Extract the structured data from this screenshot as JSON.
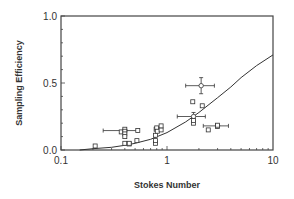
{
  "chart_data": {
    "type": "scatter",
    "title": "",
    "xlabel": "Stokes Number",
    "ylabel": "Sampling Efficiency",
    "xscale": "log",
    "xlim": [
      0.1,
      10
    ],
    "ylim": [
      0.0,
      1.0
    ],
    "xticks": [
      "0.1",
      "1",
      "10"
    ],
    "yticks": [
      "0.0",
      "0.5",
      "1.0"
    ],
    "grid": false,
    "legend": null,
    "series": [
      {
        "name": "measured",
        "marker": "square",
        "points": [
          {
            "x": 0.21,
            "y": 0.03
          },
          {
            "x": 0.37,
            "y": 0.135
          },
          {
            "x": 0.4,
            "y": 0.155
          },
          {
            "x": 0.4,
            "y": 0.14
          },
          {
            "x": 0.4,
            "y": 0.12
          },
          {
            "x": 0.4,
            "y": 0.1
          },
          {
            "x": 0.4,
            "y": 0.05
          },
          {
            "x": 0.44,
            "y": 0.045
          },
          {
            "x": 0.44,
            "y": 0.05
          },
          {
            "x": 0.52,
            "y": 0.07
          },
          {
            "x": 0.53,
            "y": 0.145
          },
          {
            "x": 0.78,
            "y": 0.05
          },
          {
            "x": 0.78,
            "y": 0.07
          },
          {
            "x": 0.78,
            "y": 0.11
          },
          {
            "x": 0.79,
            "y": 0.155
          },
          {
            "x": 0.8,
            "y": 0.165
          },
          {
            "x": 0.81,
            "y": 0.14
          },
          {
            "x": 0.88,
            "y": 0.15
          },
          {
            "x": 0.88,
            "y": 0.18
          },
          {
            "x": 1.75,
            "y": 0.36
          },
          {
            "x": 1.78,
            "y": 0.2
          },
          {
            "x": 1.78,
            "y": 0.22
          },
          {
            "x": 2.15,
            "y": 0.33
          },
          {
            "x": 2.45,
            "y": 0.15
          },
          {
            "x": 3.0,
            "y": 0.175
          },
          {
            "x": 3.0,
            "y": 0.185
          }
        ]
      },
      {
        "name": "mean with error bars",
        "marker": "circle",
        "points": [
          {
            "x": 0.4,
            "y": 0.145,
            "xerr": [
              0.25,
              0.53
            ]
          },
          {
            "x": 2.1,
            "y": 0.48,
            "xerr": [
              1.5,
              2.8
            ],
            "yerr": [
              0.42,
              0.54
            ]
          },
          {
            "x": 1.78,
            "y": 0.25,
            "xerr": [
              1.25,
              2.3
            ],
            "yerr": [
              0.22,
              0.28
            ]
          },
          {
            "x": 3.0,
            "y": 0.18,
            "xerr": [
              2.2,
              3.8
            ]
          }
        ]
      },
      {
        "name": "model curve",
        "type": "line",
        "x": [
          0.15,
          0.2,
          0.3,
          0.4,
          0.5,
          0.7,
          1.0,
          1.5,
          2.0,
          3.0,
          4.0,
          5.0,
          7.0,
          10.0
        ],
        "y": [
          0.0,
          0.01,
          0.02,
          0.035,
          0.05,
          0.08,
          0.13,
          0.21,
          0.28,
          0.39,
          0.47,
          0.54,
          0.63,
          0.71
        ]
      }
    ]
  }
}
